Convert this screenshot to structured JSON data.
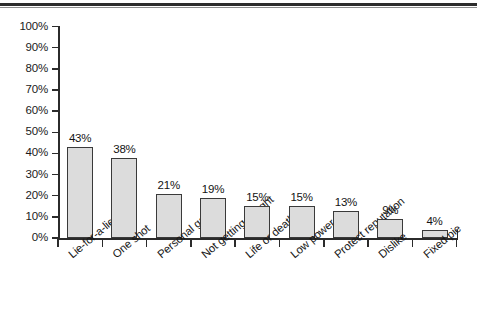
{
  "figure": {
    "name": "bar-chart-figure",
    "top_rule": true,
    "background_color": "#ffffff"
  },
  "axis": {
    "y_tick_labels": [
      "100%",
      "90%",
      "80%",
      "70%",
      "60%",
      "50%",
      "40%",
      "30%",
      "20%",
      "10%",
      "0%"
    ],
    "y_axis_color": "#2b2b2b",
    "x_axis_color": "#2b2b2b"
  },
  "style": {
    "bar_fill": "#dcdcdc",
    "bar_stroke": "#3a3a3a",
    "text_color": "#171717"
  },
  "chart_data": {
    "type": "bar",
    "title": "",
    "subtitle": "",
    "xlabel": "",
    "ylabel": "",
    "ylim": [
      0,
      100
    ],
    "ytick_step": 10,
    "grid": false,
    "legend": false,
    "value_label_suffix": "%",
    "categories": [
      "Lie-for-a-lie",
      "One shot",
      "Personal gain",
      "Not getting caught",
      "Life or death",
      "Low power",
      "Protect reputation",
      "Dislike",
      "Fixed pie"
    ],
    "values": [
      43,
      38,
      21,
      19,
      15,
      15,
      13,
      9,
      4
    ],
    "value_labels": [
      "43%",
      "38%",
      "21%",
      "19%",
      "15%",
      "15%",
      "13%",
      "9%",
      "4%"
    ]
  }
}
